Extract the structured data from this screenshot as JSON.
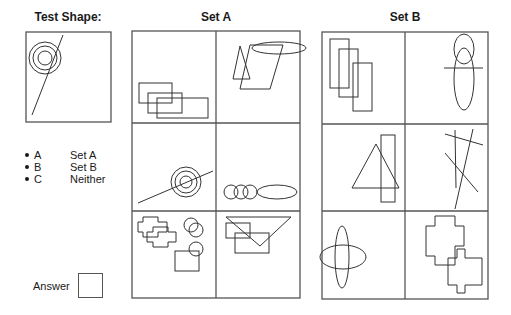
{
  "test_shape": {
    "title": "Test Shape:",
    "shapes": [
      {
        "t": "circle",
        "cx": 45,
        "cy": 58,
        "r": 16
      },
      {
        "t": "circle",
        "cx": 45,
        "cy": 58,
        "r": 12
      },
      {
        "t": "circle",
        "cx": 45,
        "cy": 58,
        "r": 7
      },
      {
        "t": "line",
        "x1": 63,
        "y1": 35,
        "x2": 32,
        "y2": 115
      }
    ]
  },
  "options": [
    {
      "key": "A",
      "label": "Set A"
    },
    {
      "key": "B",
      "label": "Set B"
    },
    {
      "key": "C",
      "label": "Neither"
    }
  ],
  "answer": {
    "label": "Answer",
    "value": ""
  },
  "set_a": {
    "title": "Set A",
    "cells": [
      {
        "name": "set-a-cell-1",
        "shapes": [
          {
            "t": "rect",
            "x": 139,
            "y": 83,
            "w": 33,
            "h": 20
          },
          {
            "t": "rect",
            "x": 148,
            "y": 93,
            "w": 34,
            "h": 20
          },
          {
            "t": "rect",
            "x": 157,
            "y": 98,
            "w": 51,
            "h": 20
          }
        ]
      },
      {
        "name": "set-a-cell-2",
        "shapes": [
          {
            "t": "ellipse",
            "cx": 279,
            "cy": 48,
            "rx": 27,
            "ry": 6
          },
          {
            "t": "poly",
            "pts": "240,46 233,79 250,79"
          },
          {
            "t": "poly",
            "pts": "250,45 283,45 270,89 240,89"
          }
        ]
      },
      {
        "name": "set-a-cell-3",
        "shapes": [
          {
            "t": "circle",
            "cx": 186,
            "cy": 182,
            "r": 15
          },
          {
            "t": "circle",
            "cx": 186,
            "cy": 182,
            "r": 11
          },
          {
            "t": "circle",
            "cx": 186,
            "cy": 182,
            "r": 6
          },
          {
            "t": "line",
            "x1": 138,
            "y1": 203,
            "x2": 213,
            "y2": 171
          }
        ]
      },
      {
        "name": "set-a-cell-4",
        "shapes": [
          {
            "t": "circle",
            "cx": 231,
            "cy": 192,
            "r": 7
          },
          {
            "t": "circle",
            "cx": 241,
            "cy": 192,
            "r": 7
          },
          {
            "t": "circle",
            "cx": 250,
            "cy": 192,
            "r": 7
          },
          {
            "t": "ellipse",
            "cx": 277,
            "cy": 192,
            "rx": 20,
            "ry": 7
          }
        ]
      },
      {
        "name": "set-a-cell-5",
        "shapes": [
          {
            "t": "poly",
            "pts": "143,217 158,217 158,222 167,222 167,232 158,232 158,237 143,237 143,232 138,232 138,222 143,222"
          },
          {
            "t": "poly",
            "pts": "153,227 168,227 168,232 176,232 176,242 168,242 168,247 153,247 153,242 147,242 147,232 153,232"
          },
          {
            "t": "circle",
            "cx": 191,
            "cy": 225,
            "r": 7
          },
          {
            "t": "circle",
            "cx": 196,
            "cy": 230,
            "r": 7
          },
          {
            "t": "circle",
            "cx": 196,
            "cy": 249,
            "r": 7
          },
          {
            "t": "rect",
            "x": 175,
            "y": 251,
            "w": 24,
            "h": 20
          }
        ]
      },
      {
        "name": "set-a-cell-6",
        "shapes": [
          {
            "t": "poly",
            "pts": "226,217 291,217 260,246"
          },
          {
            "t": "rect",
            "x": 226,
            "y": 223,
            "w": 24,
            "h": 15
          },
          {
            "t": "rect",
            "x": 235,
            "y": 233,
            "w": 34,
            "h": 20
          }
        ]
      }
    ]
  },
  "set_b": {
    "title": "Set B",
    "cells": [
      {
        "name": "set-b-cell-1",
        "shapes": [
          {
            "t": "rect",
            "x": 330,
            "y": 39,
            "w": 19,
            "h": 49
          },
          {
            "t": "rect",
            "x": 339,
            "y": 49,
            "w": 19,
            "h": 48
          },
          {
            "t": "rect",
            "x": 353,
            "y": 63,
            "w": 19,
            "h": 48
          }
        ]
      },
      {
        "name": "set-b-cell-2",
        "shapes": [
          {
            "t": "ellipse",
            "cx": 464,
            "cy": 49,
            "rx": 10,
            "ry": 15
          },
          {
            "t": "ellipse",
            "cx": 464,
            "cy": 79,
            "rx": 10,
            "ry": 31
          },
          {
            "t": "line",
            "x1": 444,
            "y1": 68,
            "x2": 483,
            "y2": 68
          }
        ]
      },
      {
        "name": "set-b-cell-3",
        "shapes": [
          {
            "t": "poly",
            "pts": "376,144 352,188 399,188"
          },
          {
            "t": "rect",
            "x": 381,
            "y": 135,
            "w": 14,
            "h": 67
          }
        ]
      },
      {
        "name": "set-b-cell-4",
        "shapes": [
          {
            "t": "line",
            "x1": 445,
            "y1": 134,
            "x2": 483,
            "y2": 145
          },
          {
            "t": "line",
            "x1": 455,
            "y1": 130,
            "x2": 456,
            "y2": 188
          },
          {
            "t": "line",
            "x1": 473,
            "y1": 129,
            "x2": 455,
            "y2": 209
          },
          {
            "t": "line",
            "x1": 445,
            "y1": 153,
            "x2": 478,
            "y2": 192
          }
        ]
      },
      {
        "name": "set-b-cell-5",
        "shapes": [
          {
            "t": "ellipse",
            "cx": 342,
            "cy": 257,
            "rx": 7,
            "ry": 31
          },
          {
            "t": "ellipse",
            "cx": 343,
            "cy": 257,
            "rx": 23,
            "ry": 12
          }
        ]
      },
      {
        "name": "set-b-cell-6",
        "shapes": [
          {
            "t": "poly",
            "pts": "435,216 455,216 455,226 464,226 464,246 455,246 455,265 435,265 435,256 426,256 426,226 435,226"
          },
          {
            "t": "poly",
            "pts": "457,249 465,249 465,258 482,258 482,285 465,285 465,293 457,293 457,285 448,285 448,258 457,258"
          }
        ]
      }
    ]
  },
  "frames": {
    "test_box": {
      "x": 26,
      "y": 32,
      "w": 85,
      "h": 90
    },
    "set_a": {
      "x": 132,
      "y": 31,
      "w": 168,
      "h": 267,
      "col": 216,
      "rows": [
        123,
        211
      ]
    },
    "set_b": {
      "x": 322,
      "y": 32,
      "w": 166,
      "h": 267,
      "col": 405,
      "rows": [
        124,
        211
      ]
    }
  }
}
